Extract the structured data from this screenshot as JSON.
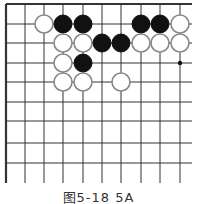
{
  "diagram": {
    "type": "go-board-fragment",
    "grid": {
      "columns_x": [
        6,
        25,
        44,
        63,
        83,
        102,
        121,
        141,
        160,
        180
      ],
      "rows_y": [
        4,
        24,
        43,
        63,
        82,
        102,
        121,
        143,
        163
      ],
      "right_extent": 192,
      "bottom_extent": 183,
      "line_color": "#333333",
      "edge_top": true,
      "edge_left": true
    },
    "stone_radius": 9,
    "stones": [
      {
        "color": "white",
        "col": 2,
        "row": 1
      },
      {
        "color": "black",
        "col": 3,
        "row": 1
      },
      {
        "color": "black",
        "col": 4,
        "row": 1
      },
      {
        "color": "black",
        "col": 7,
        "row": 1
      },
      {
        "color": "black",
        "col": 8,
        "row": 1
      },
      {
        "color": "white",
        "col": 9,
        "row": 1
      },
      {
        "color": "white",
        "col": 3,
        "row": 2
      },
      {
        "color": "white",
        "col": 4,
        "row": 2
      },
      {
        "color": "black",
        "col": 5,
        "row": 2
      },
      {
        "color": "black",
        "col": 6,
        "row": 2
      },
      {
        "color": "white",
        "col": 7,
        "row": 2
      },
      {
        "color": "white",
        "col": 8,
        "row": 2
      },
      {
        "color": "white",
        "col": 9,
        "row": 2
      },
      {
        "color": "white",
        "col": 3,
        "row": 3
      },
      {
        "color": "black",
        "col": 4,
        "row": 3
      },
      {
        "color": "white",
        "col": 3,
        "row": 4
      },
      {
        "color": "white",
        "col": 4,
        "row": 4
      },
      {
        "color": "white",
        "col": 6,
        "row": 4
      }
    ],
    "markers": [
      {
        "type": "dot",
        "col": 9,
        "row": 3
      }
    ]
  },
  "caption": "图5-18  5A"
}
